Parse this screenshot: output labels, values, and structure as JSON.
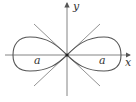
{
  "diagram": {
    "axes": {
      "x_label": "x",
      "y_label": "y"
    },
    "curve_labels": {
      "left": "a",
      "right": "a"
    },
    "colors": {
      "stroke": "#555555",
      "axis": "#777777",
      "text": "#333333"
    }
  }
}
